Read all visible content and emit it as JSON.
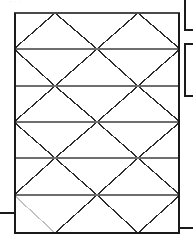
{
  "canvas": {
    "width": 193,
    "height": 239,
    "background": "#ffffff"
  },
  "drawing": {
    "title": "braced-frame-elevation",
    "type": "structural-elevation",
    "line_color": "#2b2b2b",
    "frame_color": "#1a1a1a",
    "secondary_line_color": "#6e6e6e",
    "faded_line_color": "#c9c9c9",
    "frame": {
      "x1": 14,
      "y1": 13,
      "x2": 180,
      "y2": 233
    },
    "floor_levels_y": [
      13,
      49,
      86,
      122,
      158,
      195,
      233
    ],
    "bay_x": [
      14,
      97,
      180
    ],
    "notes": {
      "bracing_pattern": "continuous X / diamond cross-bracing across two bays",
      "level_count": 6
    }
  },
  "faint_header": {
    "text": "' ' '",
    "x": 10,
    "y": 1
  },
  "left_stub": {
    "label": "left-tie-line",
    "x1": 0,
    "y1": 213,
    "x2": 14,
    "y2": 213
  },
  "right_stub": {
    "label": "right-tie-line",
    "x1": 180,
    "y1": 228,
    "x2": 193,
    "y2": 228
  },
  "right_fragments": [
    {
      "label": "panel-fragment-upper",
      "x": 185,
      "y": -6,
      "width": 18,
      "height": 36
    },
    {
      "label": "panel-fragment-lower",
      "x": 185,
      "y": 44,
      "width": 18,
      "height": 52
    }
  ]
}
